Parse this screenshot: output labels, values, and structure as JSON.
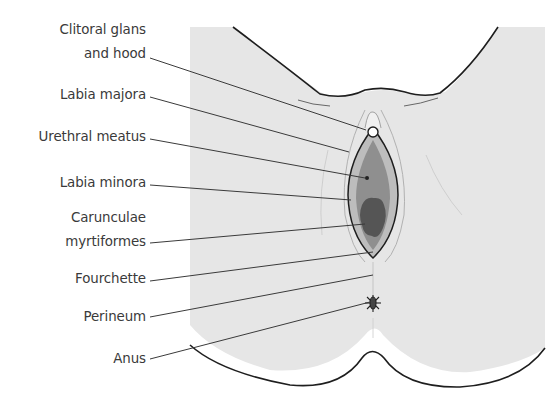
{
  "diagram": {
    "colors": {
      "skin": "#e6e6e6",
      "outline": "#1e1e1e",
      "labia_minora_fill": "#bdbdbd",
      "vestibule_fill": "#8f8f8f",
      "caruncle_fill": "#555555",
      "leader_line": "#3a3a3a",
      "label_text": "#3a3a3a"
    },
    "labels": [
      {
        "id": "clitoral-glans-hood",
        "line1": "Clitoral glans",
        "line2": "and hood"
      },
      {
        "id": "labia-majora",
        "line1": "Labia majora"
      },
      {
        "id": "urethral-meatus",
        "line1": "Urethral meatus"
      },
      {
        "id": "labia-minora",
        "line1": "Labia minora"
      },
      {
        "id": "carunculae-myrtiformes",
        "line1": "Carunculae",
        "line2": "myrtiformes"
      },
      {
        "id": "fourchette",
        "line1": "Fourchette"
      },
      {
        "id": "perineum",
        "line1": "Perineum"
      },
      {
        "id": "anus",
        "line1": "Anus"
      }
    ]
  }
}
